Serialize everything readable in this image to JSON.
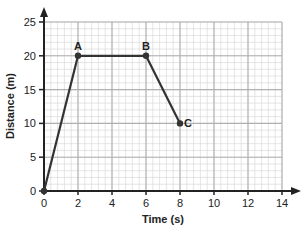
{
  "chart_data": {
    "type": "line",
    "title": "",
    "xlabel": "Time (s)",
    "ylabel": "Distance (m)",
    "xlim": [
      0,
      14
    ],
    "ylim": [
      0,
      25
    ],
    "x_ticks": [
      0,
      2,
      4,
      6,
      8,
      10,
      12,
      14
    ],
    "y_ticks": [
      0,
      5,
      10,
      15,
      20,
      25
    ],
    "grid": true,
    "series": [
      {
        "name": "Distance",
        "x": [
          0,
          2,
          6,
          8
        ],
        "y": [
          0,
          20,
          20,
          10
        ],
        "point_labels": [
          "",
          "A",
          "B",
          "C"
        ]
      }
    ],
    "annotations": [
      {
        "label": "A",
        "x": 2,
        "y": 20
      },
      {
        "label": "B",
        "x": 6,
        "y": 20
      },
      {
        "label": "C",
        "x": 8,
        "y": 10
      }
    ],
    "colors": {
      "line": "#333333",
      "grid_minor": "#d4d4d4",
      "grid_major": "#b0b0b0",
      "axis": "#222222"
    }
  }
}
